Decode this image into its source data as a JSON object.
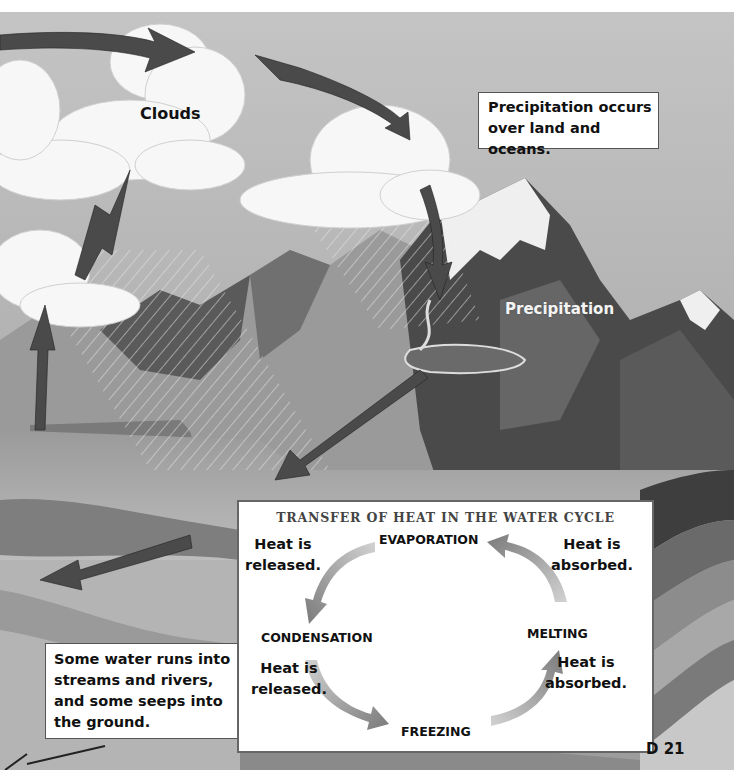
{
  "scene": {
    "labels": {
      "clouds": "Clouds",
      "precipitation": "Precipitation"
    },
    "callouts": {
      "precipitation_note": [
        "Precipitation occurs",
        "over land and oceans."
      ],
      "runoff_note": [
        "Some water runs into",
        "streams and rivers,",
        "and some seeps into",
        "the ground."
      ]
    }
  },
  "heat_diagram": {
    "title": "TRANSFER OF HEAT IN THE WATER CYCLE",
    "stages": {
      "evaporation": "EVAPORATION",
      "condensation": "CONDENSATION",
      "freezing": "FREEZING",
      "melting": "MELTING"
    },
    "transitions": [
      {
        "from": "EVAPORATION",
        "to": "CONDENSATION",
        "lines": [
          "Heat is",
          "released."
        ]
      },
      {
        "from": "CONDENSATION",
        "to": "FREEZING",
        "lines": [
          "Heat is",
          "released."
        ]
      },
      {
        "from": "FREEZING",
        "to": "MELTING",
        "lines": [
          "Heat is",
          "absorbed."
        ]
      },
      {
        "from": "MELTING",
        "to": "EVAPORATION",
        "lines": [
          "Heat is",
          "absorbed."
        ]
      }
    ]
  },
  "page": {
    "number": "D 21"
  },
  "colors": {
    "sky": "#a6a6a6",
    "arrow": "#4a4a4a",
    "cloud": "#f7f7f7",
    "mountain_dark": "#3e3e3e",
    "mountain_mid": "#8a8a8a",
    "snow": "#f0f0f0"
  }
}
